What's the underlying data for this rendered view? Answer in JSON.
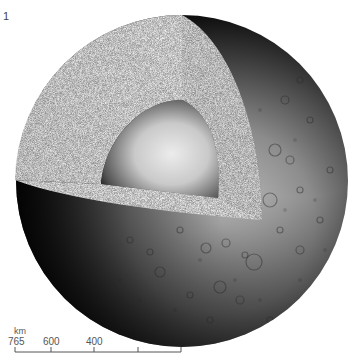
{
  "figure": {
    "number": "1",
    "layers": [
      "crust",
      "mantle",
      "core"
    ]
  },
  "scale_bar": {
    "unit": "km",
    "labels": [
      "765",
      "600",
      "400"
    ],
    "ticks": 5
  },
  "colors": {
    "background": "#ffffff",
    "cut_face": "#eeeeee",
    "core_light": "#e8e8e8",
    "core_dark": "#1a1a1a",
    "surface_light": "#bdbdbd",
    "surface_dark": "#111111",
    "scale": "#555555"
  }
}
